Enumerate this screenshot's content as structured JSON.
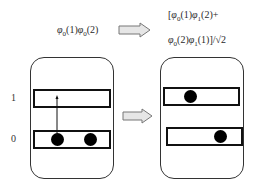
{
  "formulas": {
    "initial": {
      "phi": "φ",
      "s1": "0",
      "a1": "(1)",
      "phi2": "φ",
      "s2": "0",
      "a2": "(2)"
    },
    "final_line1": {
      "open": "[",
      "phi": "φ",
      "s1": "0",
      "a1": "(1)",
      "phi2": "φ",
      "s2": "1",
      "a2": "(2)+"
    },
    "final_line2": {
      "phi": "φ",
      "s1": "0",
      "a1": "(2)",
      "phi2": "φ",
      "s2": "1",
      "a2": "(1)]/√2"
    }
  },
  "level_labels": {
    "upper": "1",
    "lower": "0"
  },
  "arrows": [
    {
      "name": "formula-transition-arrow",
      "direction": "right"
    },
    {
      "name": "panel-transition-arrow",
      "direction": "right"
    }
  ],
  "panels": {
    "left": {
      "upper_level_electrons": 0,
      "lower_level_electrons": 2,
      "excitation_arrow": true
    },
    "right": {
      "upper_level_electrons": 1,
      "lower_level_electrons": 1
    }
  },
  "colors": {
    "stroke": "#111111",
    "arrow_fill": "#e6e6e6",
    "arrow_stroke": "#777777",
    "electron": "#000000"
  }
}
